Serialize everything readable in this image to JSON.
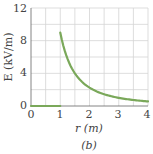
{
  "chart_data": {
    "type": "line",
    "title": "",
    "caption": "(b)",
    "xlabel": "r (m)",
    "ylabel": "E (kV/m)",
    "xlim": [
      0,
      4
    ],
    "ylim": [
      0,
      12
    ],
    "x_ticks": [
      "0",
      "1",
      "2",
      "3",
      "4"
    ],
    "y_ticks": [
      "0",
      "4",
      "8",
      "12"
    ],
    "grid": true,
    "legend": null,
    "series": [
      {
        "name": "E(r)",
        "color": "#7aa85a",
        "x": [
          0,
          0.5,
          1.0,
          1.0,
          1.25,
          1.5,
          1.75,
          2.0,
          2.5,
          3.0,
          3.5,
          4.0
        ],
        "y": [
          0,
          0,
          0,
          9.0,
          5.76,
          4.0,
          2.94,
          2.25,
          1.44,
          1.0,
          0.73,
          0.56
        ]
      }
    ]
  },
  "labels": {
    "x_axis": "r (m)",
    "y_axis": "E (kV/m)",
    "caption": "(b)",
    "x_ticks": [
      "0",
      "1",
      "2",
      "3",
      "4"
    ],
    "y_ticks": [
      "0",
      "4",
      "8",
      "12"
    ]
  }
}
